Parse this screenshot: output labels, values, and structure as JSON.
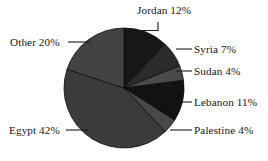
{
  "chart_data": {
    "type": "pie",
    "title": "",
    "subtitle": "",
    "xlabel": "",
    "ylabel": "",
    "legend_position": "none",
    "grid": false,
    "labels_show_percent": true,
    "categories": [
      "Jordan",
      "Syria",
      "Sudan",
      "Lebanon",
      "Palestine",
      "Egypt",
      "Other"
    ],
    "values": [
      12,
      7,
      4,
      11,
      4,
      42,
      20
    ],
    "units": "percent",
    "total": 100,
    "slices": [
      {
        "name": "Jordan",
        "value": 12,
        "label": "Jordan 12%",
        "color": "#171717",
        "start_angle": 0,
        "end_angle": 43.2
      },
      {
        "name": "Syria",
        "value": 7,
        "label": "Syria 7%",
        "color": "#2b2b2b",
        "start_angle": 43.2,
        "end_angle": 68.4
      },
      {
        "name": "Sudan",
        "value": 4,
        "label": "Sudan 4%",
        "color": "#4a4a4a",
        "start_angle": 68.4,
        "end_angle": 82.8
      },
      {
        "name": "Lebanon",
        "value": 11,
        "label": "Lebanon 11%",
        "color": "#121212",
        "start_angle": 82.8,
        "end_angle": 122.4
      },
      {
        "name": "Palestine",
        "value": 4,
        "label": "Palestine 4%",
        "color": "#484848",
        "start_angle": 122.4,
        "end_angle": 136.8
      },
      {
        "name": "Egypt",
        "value": 42,
        "label": "Egypt 42%",
        "color": "#3b3b3b",
        "start_angle": 136.8,
        "end_angle": 288.0
      },
      {
        "name": "Other",
        "value": 20,
        "label": "Other 20%",
        "color": "#434343",
        "start_angle": 288.0,
        "end_angle": 360.0
      }
    ],
    "geometry": {
      "center_x": 124,
      "center_y": 88,
      "radius": 60,
      "start_at_twelve_oclock": true,
      "direction": "clockwise"
    }
  },
  "labels": {
    "jordan": "Jordan 12%",
    "syria": "Syria 7%",
    "sudan": "Sudan 4%",
    "lebanon": "Lebanon 11%",
    "palestine": "Palestine 4%",
    "egypt": "Egypt 42%",
    "other": "Other 20%"
  },
  "colors": {
    "background": "#ffffff",
    "text": "#161616",
    "leader_line": "#1a1a1a",
    "slice_edge": "#0e0e0e"
  }
}
